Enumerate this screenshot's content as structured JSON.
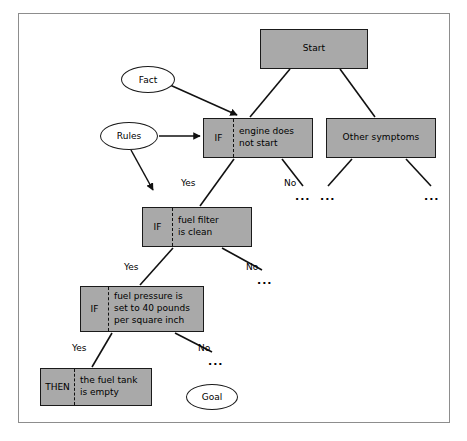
{
  "diagram": {
    "colors": {
      "node_fill": "#a9a9a9",
      "node_border": "#1a1a1a",
      "frame_border": "#8d8d8d",
      "page_background": "#ffffff",
      "text": "#000000"
    },
    "nodes": [
      {
        "id": "start",
        "kind": "box",
        "keyword": "",
        "text": "Start",
        "x": 260,
        "y": 29,
        "w": 108,
        "h": 40
      },
      {
        "id": "engine-does-not-start",
        "kind": "box-if",
        "keyword": "IF",
        "text": "engine does\nnot start",
        "x": 203,
        "y": 118,
        "w": 110,
        "h": 40
      },
      {
        "id": "other-symptoms",
        "kind": "box",
        "keyword": "",
        "text": "Other symptoms",
        "x": 326,
        "y": 118,
        "w": 110,
        "h": 40
      },
      {
        "id": "fuel-filter-is-clean",
        "kind": "box-if",
        "keyword": "IF",
        "text": "fuel filter\nis clean",
        "x": 142,
        "y": 207,
        "w": 110,
        "h": 40
      },
      {
        "id": "fuel-pressure",
        "kind": "box-if",
        "keyword": "IF",
        "text": "fuel pressure is\nset to 40 pounds\nper square inch",
        "x": 80,
        "y": 286,
        "w": 124,
        "h": 46
      },
      {
        "id": "the-fuel-tank-is-empty",
        "kind": "box-then",
        "keyword": "THEN",
        "text": "the fuel tank\nis empty",
        "x": 40,
        "y": 368,
        "w": 112,
        "h": 38
      }
    ],
    "ellipses": [
      {
        "id": "fact",
        "text": "Fact",
        "x": 121,
        "y": 66,
        "w": 54,
        "h": 27
      },
      {
        "id": "rules",
        "text": "Rules",
        "x": 100,
        "y": 122,
        "w": 58,
        "h": 28
      },
      {
        "id": "goal",
        "text": "Goal",
        "x": 186,
        "y": 384,
        "w": 52,
        "h": 26
      }
    ],
    "edge_labels": [
      {
        "id": "yes-1",
        "text": "Yes",
        "x": 181,
        "y": 178
      },
      {
        "id": "no-1",
        "text": "No",
        "x": 284,
        "y": 178
      },
      {
        "id": "yes-2",
        "text": "Yes",
        "x": 124,
        "y": 262
      },
      {
        "id": "no-2",
        "text": "No",
        "x": 246,
        "y": 262
      },
      {
        "id": "yes-3",
        "text": "Yes",
        "x": 72,
        "y": 343
      },
      {
        "id": "no-3",
        "text": "No",
        "x": 198,
        "y": 343
      }
    ],
    "ellipsis_markers": [
      {
        "id": "dots-no-1",
        "text": "...",
        "x": 295,
        "y": 191
      },
      {
        "id": "dots-other-l",
        "text": "...",
        "x": 320,
        "y": 191
      },
      {
        "id": "dots-other-r",
        "text": "...",
        "x": 424,
        "y": 191
      },
      {
        "id": "dots-no-2",
        "text": "...",
        "x": 257,
        "y": 275
      },
      {
        "id": "dots-no-3",
        "text": "...",
        "x": 208,
        "y": 356
      }
    ]
  }
}
